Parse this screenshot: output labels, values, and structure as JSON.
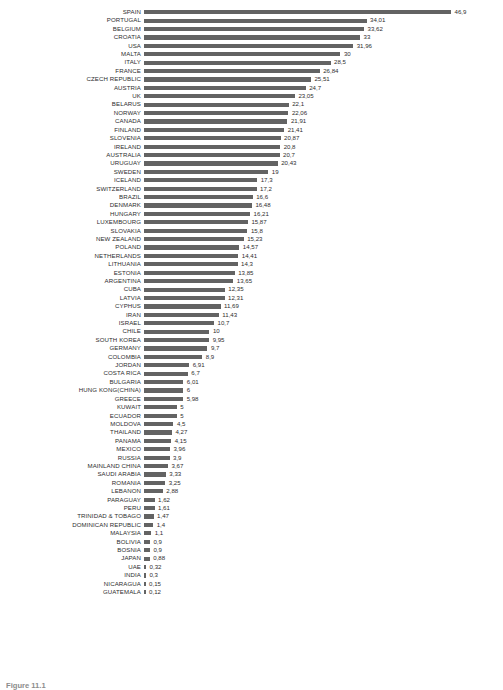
{
  "chart_data": {
    "type": "bar",
    "orientation": "horizontal",
    "title": "",
    "subtitle": "",
    "xlabel": "",
    "ylabel": "",
    "grid": false,
    "legend": null,
    "xlim": [
      0,
      46.9
    ],
    "value_decimal_separator": ",",
    "bar_color": "#636363",
    "categories": [
      "SPAIN",
      "PORTUGAL",
      "BELGIUM",
      "CROATIA",
      "USA",
      "MALTA",
      "ITALY",
      "FRANCE",
      "CZECH REPUBLIC",
      "AUSTRIA",
      "UK",
      "BELARUS",
      "NORWAY",
      "CANADA",
      "FINLAND",
      "SLOVENIA",
      "IRELAND",
      "AUSTRALIA",
      "URUGUAY",
      "SWEDEN",
      "ICELAND",
      "SWITZERLAND",
      "BRAZIL",
      "DENMARK",
      "HUNGARY",
      "LUXEMBOURG",
      "SLOVAKIA",
      "NEW ZEALAND",
      "POLAND",
      "NETHERLANDS",
      "LITHUANIA",
      "ESTONIA",
      "ARGENTINA",
      "CUBA",
      "LATVIA",
      "CYPHUS",
      "IRAN",
      "ISRAEL",
      "CHILE",
      "SOUTH KOREA",
      "GERMANY",
      "COLOMBIA",
      "JORDAN",
      "COSTA RICA",
      "BULGARIA",
      "HUNG KONG(CHINA)",
      "GREECE",
      "KUWAIT",
      "ECUADOR",
      "MOLDOVA",
      "THAILAND",
      "PANAMA",
      "MEXICO",
      "RUSSIA",
      "MAINLAND CHINA",
      "SAUDI ARABIA",
      "ROMANIA",
      "LEBANON",
      "PARAGUAY",
      "PERU",
      "TRINIDAD & TOBAGO",
      "DOMINICAN REPUBLIC",
      "MALAYSIA",
      "BOLIVIA",
      "BOSNIA",
      "JAPAN",
      "UAE",
      "INDIA",
      "NICARAGUA",
      "GUATEMALA"
    ],
    "values": [
      46.9,
      34.01,
      33.62,
      33,
      31.96,
      30,
      28.5,
      26.84,
      25.51,
      24.7,
      23.05,
      22.1,
      22.06,
      21.91,
      21.41,
      20.87,
      20.8,
      20.7,
      20.43,
      19,
      17.3,
      17.2,
      16.6,
      16.48,
      16.21,
      15.87,
      15.8,
      15.23,
      14.57,
      14.41,
      14.3,
      13.85,
      13.65,
      12.35,
      12.31,
      11.69,
      11.43,
      10.7,
      10,
      9.95,
      9.7,
      8.9,
      6.91,
      6.7,
      6.01,
      6,
      5.98,
      5,
      5,
      4.5,
      4.27,
      4.15,
      3.96,
      3.9,
      3.67,
      3.33,
      3.25,
      2.88,
      1.62,
      1.61,
      1.47,
      1.4,
      1.1,
      0.9,
      0.9,
      0.88,
      0.32,
      0.3,
      0.15,
      0.12
    ],
    "value_labels": [
      "46,9",
      "34,01",
      "33,62",
      "33",
      "31,96",
      "30",
      "28,5",
      "26,84",
      "25,51",
      "24,7",
      "23,05",
      "22,1",
      "22,06",
      "21,91",
      "21,41",
      "20,87",
      "20,8",
      "20,7",
      "20,43",
      "19",
      "17,3",
      "17,2",
      "16,6",
      "16,48",
      "16,21",
      "15,87",
      "15,8",
      "15,23",
      "14,57",
      "14,41",
      "14,3",
      "13,85",
      "13,65",
      "12,35",
      "12,31",
      "11,69",
      "11,43",
      "10,7",
      "10",
      "9,95",
      "9,7",
      "8,9",
      "6,91",
      "6,7",
      "6,01",
      "6",
      "5,98",
      "5",
      "5",
      "4,5",
      "4,27",
      "4,15",
      "3,96",
      "3,9",
      "3,67",
      "3,33",
      "3,25",
      "2,88",
      "1,62",
      "1,61",
      "1,47",
      "1,4",
      "1,1",
      "0,9",
      "0,9",
      "0,88",
      "0,32",
      "0,3",
      "0,15",
      "0,12"
    ]
  },
  "caption": {
    "figure_number": "Figure 11.1",
    "text": ""
  }
}
